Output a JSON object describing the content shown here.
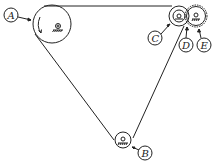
{
  "diagram": {
    "type": "belt-pulley-system",
    "labels": {
      "A": "A",
      "B": "B",
      "C": "C",
      "D": "D",
      "E": "E"
    },
    "colors": {
      "line": "#222222",
      "background": "#ffffff"
    },
    "pulleys": [
      {
        "id": "A",
        "role": "large drive pulley",
        "rotation": "counterclockwise arrow"
      },
      {
        "id": "B",
        "role": "bottom idler pulley"
      },
      {
        "id": "C",
        "role": "small pulley"
      },
      {
        "id": "D",
        "role": "contact point"
      },
      {
        "id": "E",
        "role": "gear wheel"
      }
    ]
  }
}
